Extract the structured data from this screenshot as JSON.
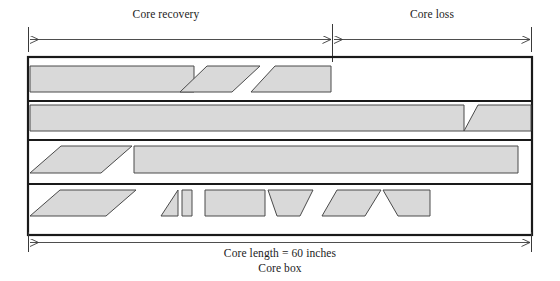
{
  "figure": {
    "title_top_left": "Core recovery",
    "title_top_right": "Core loss",
    "caption_length": "Core length = 60 inches",
    "caption_box": "Core box",
    "colors": {
      "core_fill": "#d9d9d9",
      "core_stroke": "#4a4a4a",
      "box_stroke": "#1a1a1a",
      "dimension_line": "#3a3a3a",
      "background": "#ffffff"
    },
    "dimensions": {
      "core_length_inches": 60,
      "box_left_px": 28,
      "box_right_px": 532,
      "recovery_boundary_px": 332
    },
    "top_dimension": {
      "left_segment_label": "Core recovery",
      "right_segment_label": "Core loss",
      "left_arrow": "arrow-left",
      "right_arrow": "arrow-right"
    },
    "bottom_dimension": {
      "label": "Core length = 60 inches",
      "left_arrow": "arrow-left",
      "right_arrow": "arrow-right"
    },
    "rows": [
      {
        "name": "core-row-1",
        "pieces": [
          {
            "name": "piece-1-1",
            "shape": "rectangle",
            "points": "30,66 194,66 194,92 30,92"
          },
          {
            "name": "piece-1-2",
            "shape": "parallelogram",
            "points": "207,66 260,66 232,92 180,92"
          },
          {
            "name": "piece-1-3",
            "shape": "trapezoid",
            "points": "275,66 331,66 331,92 251,92"
          }
        ]
      },
      {
        "name": "core-row-2",
        "pieces": [
          {
            "name": "piece-2-1",
            "shape": "rectangle",
            "points": "30,105 464,105 464,131 30,131"
          },
          {
            "name": "piece-2-2",
            "shape": "parallelogram",
            "points": "478,105 531,105 531,131 464,131"
          }
        ]
      },
      {
        "name": "core-row-3",
        "pieces": [
          {
            "name": "piece-3-1",
            "shape": "parallelogram",
            "points": "61,146 132,146 101,173 30,173"
          },
          {
            "name": "piece-3-2",
            "shape": "rectangle",
            "points": "134,146 518,146 518,173 134,173"
          }
        ]
      },
      {
        "name": "core-row-4",
        "pieces": [
          {
            "name": "piece-4-1",
            "shape": "parallelogram",
            "points": "60,190 136,190 106,216 30,216"
          },
          {
            "name": "piece-4-2",
            "shape": "triangle",
            "points": "178,190 178,216 161,216"
          },
          {
            "name": "piece-4-3",
            "shape": "rectangle",
            "points": "182,190 192,190 192,216 182,216"
          },
          {
            "name": "piece-4-4",
            "shape": "rectangle",
            "points": "205,190 265,190 265,216 205,216"
          },
          {
            "name": "piece-4-5",
            "shape": "trapezoid",
            "points": "268,190 313,190 300,216 277,216"
          },
          {
            "name": "piece-4-6",
            "shape": "parallelogram",
            "points": "337,190 381,190 365,216 322,216"
          },
          {
            "name": "piece-4-7",
            "shape": "trapezoid",
            "points": "383,190 430,190 430,216 398,216"
          }
        ]
      }
    ]
  }
}
